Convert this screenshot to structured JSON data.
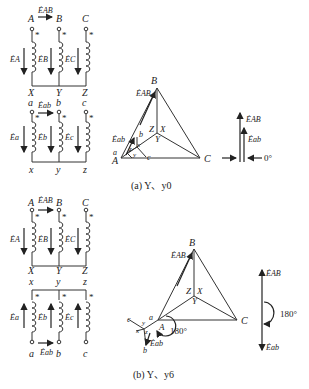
{
  "panel_a": {
    "caption": "(a) Y、y0",
    "primary_terminals_top": [
      "A",
      "B",
      "C"
    ],
    "primary_terminals_bottom": [
      "X",
      "Y",
      "Z"
    ],
    "primary_emf": [
      "ĖA",
      "ĖB",
      "ĖC"
    ],
    "line_emf_primary": "ĖAB",
    "secondary_terminals_top": [
      "a",
      "b",
      "c"
    ],
    "secondary_terminals_bottom": [
      "x",
      "y",
      "z"
    ],
    "secondary_emf": [
      "Ėa",
      "Ėb",
      "Ėc"
    ],
    "line_emf_secondary": "Ėab",
    "dot_mark": "*",
    "phasor": {
      "vertices": [
        "A",
        "B",
        "C"
      ],
      "neutral": [
        "Z",
        "X",
        "Y"
      ],
      "sec_labels": [
        "a",
        "b",
        "c",
        "x",
        "y",
        "z"
      ],
      "E_AB": "ĖAB",
      "E_ab": "Ėab"
    },
    "clock": {
      "E_AB": "ĖAB",
      "E_ab": "Ėab",
      "angle": "0°"
    }
  },
  "panel_b": {
    "caption": "(b) Y、y6",
    "primary_terminals_top": [
      "A",
      "B",
      "C"
    ],
    "primary_terminals_bottom": [
      "X",
      "Y",
      "Z"
    ],
    "primary_emf": [
      "ĖA",
      "ĖB",
      "ĖC"
    ],
    "line_emf_primary": "ĖAB",
    "secondary_terminals_top": [
      "x",
      "y",
      "z"
    ],
    "secondary_terminals_bottom": [
      "a",
      "b",
      "c"
    ],
    "secondary_emf": [
      "Ėa",
      "Ėb",
      "Ėc"
    ],
    "line_emf_secondary": "Ėab",
    "dot_mark": "*",
    "phasor": {
      "vertices": [
        "A",
        "B",
        "C"
      ],
      "neutral": [
        "Z",
        "X",
        "Y"
      ],
      "sec_labels": [
        "a",
        "b",
        "c",
        "x",
        "y",
        "z"
      ],
      "E_AB": "ĖAB",
      "E_ab": "Ėab",
      "angle": "180°"
    },
    "clock": {
      "E_AB": "ĖAB",
      "E_ab": "Ėab",
      "angle": "180°"
    }
  }
}
